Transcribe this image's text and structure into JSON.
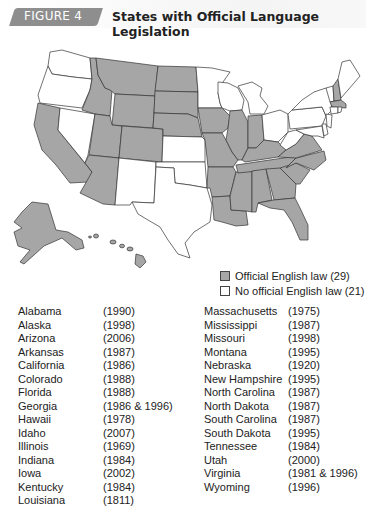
{
  "header": {
    "figure_label": "FIGURE 4",
    "title": "States with Official Language Legislation"
  },
  "colors": {
    "official": "#a6a6a6",
    "none": "#ffffff",
    "badge": "#8e8e8e",
    "border": "#333333"
  },
  "legend": {
    "items": [
      {
        "label": "Official English law (29)",
        "color": "#a6a6a6"
      },
      {
        "label": "No official English law (21)",
        "color": "#ffffff"
      }
    ]
  },
  "states_list": {
    "column1": [
      {
        "state": "Alabama",
        "year": "(1990)"
      },
      {
        "state": "Alaska",
        "year": "(1998)"
      },
      {
        "state": "Arizona",
        "year": "(2006)"
      },
      {
        "state": "Arkansas",
        "year": "(1987)"
      },
      {
        "state": "California",
        "year": "(1986)"
      },
      {
        "state": "Colorado",
        "year": "(1988)"
      },
      {
        "state": "Florida",
        "year": "(1988)"
      },
      {
        "state": "Georgia",
        "year": "(1986 & 1996)"
      },
      {
        "state": "Hawaii",
        "year": "(1978)"
      },
      {
        "state": "Idaho",
        "year": "(2007)"
      },
      {
        "state": "Illinois",
        "year": "(1969)"
      },
      {
        "state": "Indiana",
        "year": "(1984)"
      },
      {
        "state": "Iowa",
        "year": "(2002)"
      },
      {
        "state": "Kentucky",
        "year": "(1984)"
      },
      {
        "state": "Louisiana",
        "year": "(1811)"
      }
    ],
    "column2": [
      {
        "state": "Massachusetts",
        "year": "(1975)"
      },
      {
        "state": "Mississippi",
        "year": "(1987)"
      },
      {
        "state": "Missouri",
        "year": "(1998)"
      },
      {
        "state": "Montana",
        "year": "(1995)"
      },
      {
        "state": "Nebraska",
        "year": "(1920)"
      },
      {
        "state": "New Hampshire",
        "year": "(1995)"
      },
      {
        "state": "North Carolina",
        "year": "(1987)"
      },
      {
        "state": "North Dakota",
        "year": "(1987)"
      },
      {
        "state": "South Carolina",
        "year": "(1987)"
      },
      {
        "state": "South Dakota",
        "year": "(1995)"
      },
      {
        "state": "Tennessee",
        "year": "(1984)"
      },
      {
        "state": "Utah",
        "year": "(2000)"
      },
      {
        "state": "Virginia",
        "year": "(1981 & 1996)"
      },
      {
        "state": "Wyoming",
        "year": "(1996)"
      }
    ]
  },
  "map": {
    "official_states": [
      "AL",
      "AK",
      "AZ",
      "AR",
      "CA",
      "CO",
      "FL",
      "GA",
      "HI",
      "ID",
      "IL",
      "IN",
      "IA",
      "KY",
      "LA",
      "MA",
      "MS",
      "MO",
      "MT",
      "NE",
      "NH",
      "NC",
      "ND",
      "SC",
      "SD",
      "TN",
      "UT",
      "VA",
      "WY"
    ],
    "no_law_states": [
      "WA",
      "OR",
      "NV",
      "NM",
      "TX",
      "OK",
      "KS",
      "MN",
      "WI",
      "MI",
      "OH",
      "WV",
      "PA",
      "NY",
      "VT",
      "ME",
      "CT",
      "RI",
      "NJ",
      "DE",
      "MD"
    ]
  }
}
